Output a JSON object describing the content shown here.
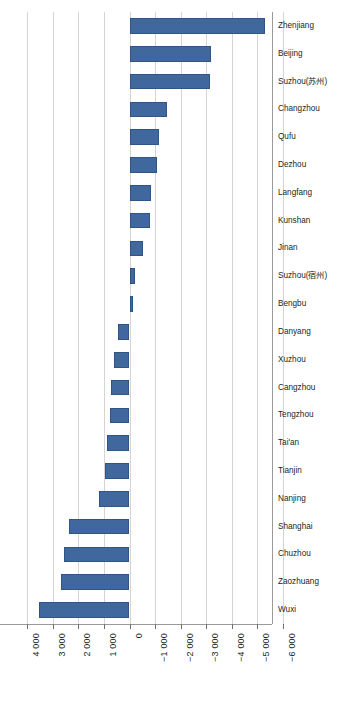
{
  "chart_data": {
    "type": "bar",
    "orientation": "horizontal",
    "title": "",
    "subtitle": "",
    "xlabel": "",
    "ylabel": "",
    "xlim": [
      4000,
      -6000
    ],
    "axis_direction": "reversed",
    "grid": true,
    "legend": false,
    "legend_position": "none",
    "bar_color": "#41689e",
    "bar_border_color": "#2f5584",
    "gridline_color": "#d4d4d4",
    "axis_color": "#9a9a9a",
    "text_color": "#231f20",
    "categories": [
      "Zhenjiang",
      "Beijing",
      "Suzhou(苏州)",
      "Changzhou",
      "Qufu",
      "Dezhou",
      "Langfang",
      "Kunshan",
      "Jinan",
      "Suzhou(宿州)",
      "Bengbu",
      "Danyang",
      "Xuzhou",
      "Cangzhou",
      "Tengzhou",
      "Tai'an",
      "Tianjin",
      "Nanjing",
      "Shanghai",
      "Chuzhou",
      "Zaozhuang",
      "Wuxi"
    ],
    "values": [
      -5300,
      -3200,
      -3150,
      -1450,
      -1150,
      -1070,
      -830,
      -810,
      -540,
      -230,
      -150,
      440,
      620,
      730,
      780,
      890,
      960,
      1200,
      2380,
      2580,
      2700,
      3540
    ],
    "xticks": [
      4000,
      3000,
      2000,
      1000,
      0,
      -1000,
      -2000,
      -3000,
      -4000,
      -5000,
      -6000
    ],
    "xticklabels": [
      "4 000",
      "3 000",
      "2 000",
      "1 000",
      "0",
      "−1 000",
      "−2 000",
      "−3 000",
      "−4 000",
      "−5 000",
      "−6 000"
    ]
  }
}
